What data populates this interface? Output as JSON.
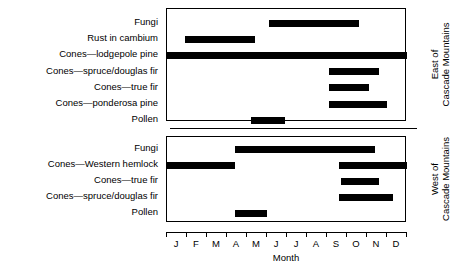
{
  "chart_data": {
    "type": "bar",
    "subtype": "gantt-timeline",
    "title": "",
    "xlabel": "Month",
    "ylabel": "",
    "xlim": [
      0,
      12
    ],
    "grid": false,
    "legend": null,
    "tick_labels": [
      "J",
      "F",
      "M",
      "A",
      "M",
      "J",
      "J",
      "A",
      "S",
      "O",
      "N",
      "D"
    ],
    "tick_label_names": [
      "January",
      "February",
      "March",
      "April",
      "May",
      "June",
      "July",
      "August",
      "September",
      "October",
      "November",
      "December"
    ],
    "panels": [
      {
        "id": "east",
        "side_label_line1": "East of",
        "side_label_line2": "Cascade Mountains",
        "rows": [
          {
            "label": "Fungi",
            "intervals": [
              {
                "start": 5.1,
                "end": 9.6
              }
            ]
          },
          {
            "label": "Rust in cambium",
            "intervals": [
              {
                "start": 0.9,
                "end": 4.4
              }
            ]
          },
          {
            "label": "Cones—lodgepole pine",
            "intervals": [
              {
                "start": 0,
                "end": 12
              }
            ]
          },
          {
            "label": "Cones—spruce/douglas fir",
            "intervals": [
              {
                "start": 8.1,
                "end": 10.6
              }
            ]
          },
          {
            "label": "Cones—true fir",
            "intervals": [
              {
                "start": 8.1,
                "end": 10.1
              }
            ]
          },
          {
            "label": "Cones—ponderosa pine",
            "intervals": [
              {
                "start": 8.1,
                "end": 11.0
              }
            ]
          },
          {
            "label": "Pollen",
            "intervals": [
              {
                "start": 4.2,
                "end": 5.9
              }
            ]
          }
        ]
      },
      {
        "id": "west",
        "side_label_line1": "West of",
        "side_label_line2": "Cascade Mountains",
        "rows": [
          {
            "label": "Fungi",
            "intervals": [
              {
                "start": 3.4,
                "end": 10.4
              }
            ]
          },
          {
            "label": "Cones—Western hemlock",
            "intervals": [
              {
                "start": 0,
                "end": 3.4
              },
              {
                "start": 8.6,
                "end": 12
              }
            ]
          },
          {
            "label": "Cones—true fir",
            "intervals": [
              {
                "start": 8.7,
                "end": 10.6
              }
            ]
          },
          {
            "label": "Cones—spruce/douglas fir",
            "intervals": [
              {
                "start": 8.6,
                "end": 11.3
              }
            ]
          },
          {
            "label": "Pollen",
            "intervals": [
              {
                "start": 3.4,
                "end": 5.0
              }
            ]
          }
        ]
      }
    ],
    "colors": {
      "bar": "#000000",
      "axis": "#000000",
      "background": "#ffffff"
    }
  }
}
